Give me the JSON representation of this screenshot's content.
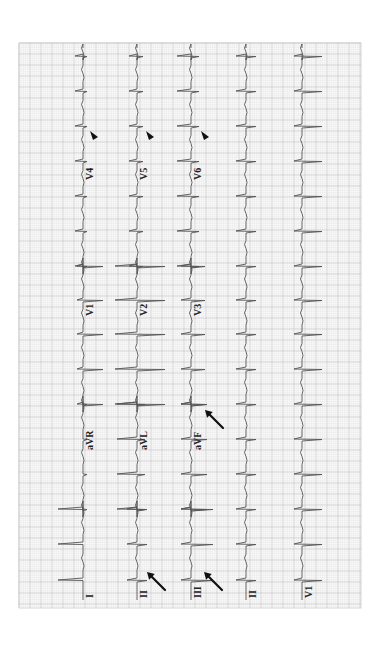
{
  "figure": {
    "grid": {
      "x": 19,
      "y": 43,
      "width": 342,
      "height": 565,
      "minor_px": 2.2,
      "major_px": 11,
      "minor_color": "#e2e2e2",
      "major_color": "#c4c4c4",
      "border_color": "#d6d6d6"
    },
    "trace_color": "#555555",
    "beats_y": [
      56,
      91,
      126,
      161,
      196,
      231,
      266,
      300,
      334,
      369,
      404,
      439,
      474,
      509,
      544,
      580
    ],
    "rows": [
      {
        "x": 83,
        "segments": [
          {
            "lead": "I",
            "label_y": 598,
            "from": 509,
            "to": 600,
            "qrs_left": 25,
            "tick_right": 0
          },
          {
            "lead": "aVR",
            "label_y": 450,
            "from": 404,
            "to": 509,
            "qrs_left": 0,
            "tick_right": 4
          },
          {
            "lead": "V1",
            "label_y": 316,
            "from": 266,
            "to": 404,
            "qrs_left": 6,
            "tick_right": 20
          },
          {
            "lead": "V4",
            "label_y": 180,
            "from": 48,
            "to": 266,
            "qrs_left": 8,
            "tick_right": 4
          }
        ],
        "marker": {
          "type": "arrowhead",
          "x": 95,
          "y": 136
        }
      },
      {
        "x": 137,
        "segments": [
          {
            "lead": "II",
            "label_y": 598,
            "from": 509,
            "to": 600,
            "qrs_left": 10,
            "tick_right": 10
          },
          {
            "lead": "aVL",
            "label_y": 450,
            "from": 404,
            "to": 509,
            "qrs_left": 20,
            "tick_right": 8
          },
          {
            "lead": "V2",
            "label_y": 316,
            "from": 266,
            "to": 404,
            "qrs_left": 22,
            "tick_right": 28
          },
          {
            "lead": "V5",
            "label_y": 180,
            "from": 48,
            "to": 266,
            "qrs_left": 8,
            "tick_right": 6
          }
        ],
        "marker": {
          "type": "arrowhead",
          "x": 151,
          "y": 136
        }
      },
      {
        "x": 191,
        "segments": [
          {
            "lead": "III",
            "label_y": 598,
            "from": 509,
            "to": 600,
            "qrs_left": 10,
            "tick_right": 22
          },
          {
            "lead": "aVF",
            "label_y": 450,
            "from": 404,
            "to": 509,
            "qrs_left": 10,
            "tick_right": 16
          },
          {
            "lead": "V3",
            "label_y": 316,
            "from": 266,
            "to": 404,
            "qrs_left": 10,
            "tick_right": 14
          },
          {
            "lead": "V6",
            "label_y": 180,
            "from": 48,
            "to": 266,
            "qrs_left": 14,
            "tick_right": 8
          }
        ],
        "marker": {
          "type": "arrowhead",
          "x": 206,
          "y": 136
        }
      },
      {
        "x": 246,
        "segments": [
          {
            "lead": "II",
            "label_y": 598,
            "from": 48,
            "to": 600,
            "qrs_left": 10,
            "tick_right": 10
          }
        ]
      },
      {
        "x": 302,
        "segments": [
          {
            "lead": "V1",
            "label_y": 598,
            "from": 48,
            "to": 600,
            "qrs_left": 8,
            "tick_right": 20
          }
        ]
      }
    ],
    "arrows": [
      {
        "x1": 165,
        "y1": 590,
        "x2": 147,
        "y2": 572
      },
      {
        "x1": 222,
        "y1": 590,
        "x2": 204,
        "y2": 572
      },
      {
        "x1": 223,
        "y1": 428,
        "x2": 205,
        "y2": 410
      }
    ],
    "annotation_legend": {
      "arrowheads": "Arrowheads in V4, V5, V6",
      "arrows": "Arrows in II, III, aVF"
    }
  }
}
